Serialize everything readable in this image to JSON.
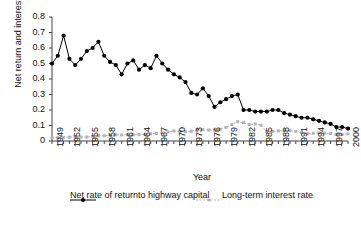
{
  "chart_data": {
    "type": "line",
    "title": "",
    "xlabel": "Year",
    "ylabel": "Net return and interest rate",
    "xlim": [
      1949,
      2000
    ],
    "ylim": [
      0,
      0.8
    ],
    "grid": false,
    "legend_position": "bottom",
    "ytick_labels": [
      "0.8",
      "0.7",
      "0.6",
      "0.5",
      "0.4",
      "0.3",
      "0.2",
      "0.1",
      "0"
    ],
    "ytick_values": [
      0.8,
      0.7,
      0.6,
      0.5,
      0.4,
      0.3,
      0.2,
      0.1,
      0
    ],
    "xtick_labels": [
      "1949",
      "1952",
      "1955",
      "1958",
      "1961",
      "1964",
      "1967",
      "1970",
      "1973",
      "1976",
      "1979",
      "1982",
      "1985",
      "1988",
      "1991",
      "1994",
      "1997",
      "2000"
    ],
    "x": [
      1949,
      1950,
      1951,
      1952,
      1953,
      1954,
      1955,
      1956,
      1957,
      1958,
      1959,
      1960,
      1961,
      1962,
      1963,
      1964,
      1965,
      1966,
      1967,
      1968,
      1969,
      1970,
      1971,
      1972,
      1973,
      1974,
      1975,
      1976,
      1977,
      1978,
      1979,
      1980,
      1981,
      1982,
      1983,
      1984,
      1985,
      1986,
      1987,
      1988,
      1989,
      1990,
      1991,
      1992,
      1993,
      1994,
      1995,
      1996,
      1997,
      1998,
      1999,
      2000
    ],
    "series": [
      {
        "name": "Net rate of return to highway capital",
        "color": "#000000",
        "style": "solid-marker",
        "values": [
          0.5,
          0.55,
          0.68,
          0.53,
          0.49,
          0.53,
          0.58,
          0.6,
          0.64,
          0.55,
          0.51,
          0.49,
          0.43,
          0.5,
          0.52,
          0.46,
          0.49,
          0.47,
          0.55,
          0.5,
          0.46,
          0.43,
          0.41,
          0.38,
          0.31,
          0.3,
          0.34,
          0.29,
          0.22,
          0.25,
          0.27,
          0.29,
          0.3,
          0.2,
          0.2,
          0.19,
          0.19,
          0.19,
          0.2,
          0.2,
          0.18,
          0.17,
          0.16,
          0.15,
          0.15,
          0.14,
          0.13,
          0.12,
          0.11,
          0.09,
          0.09,
          0.08
        ]
      },
      {
        "name": "Long-term interest rate",
        "color": "#b3b3b3",
        "style": "dashed-marker",
        "values": [
          0.021,
          0.022,
          0.024,
          0.025,
          0.027,
          0.026,
          0.026,
          0.029,
          0.034,
          0.034,
          0.039,
          0.04,
          0.039,
          0.04,
          0.04,
          0.041,
          0.042,
          0.047,
          0.048,
          0.053,
          0.059,
          0.065,
          0.061,
          0.06,
          0.063,
          0.069,
          0.072,
          0.071,
          0.071,
          0.077,
          0.088,
          0.107,
          0.125,
          0.118,
          0.106,
          0.11,
          0.102,
          0.06,
          0.062,
          0.065,
          0.066,
          0.067,
          0.062,
          0.055,
          0.047,
          0.05,
          0.052,
          0.051,
          0.048,
          0.042,
          0.042,
          0.046
        ]
      }
    ]
  },
  "legend": {
    "entries": [
      {
        "label_line1": "Net rate of return",
        "label_line2": "to highway capital"
      },
      {
        "label_line1": "Long-term interest rate",
        "label_line2": ""
      }
    ]
  }
}
